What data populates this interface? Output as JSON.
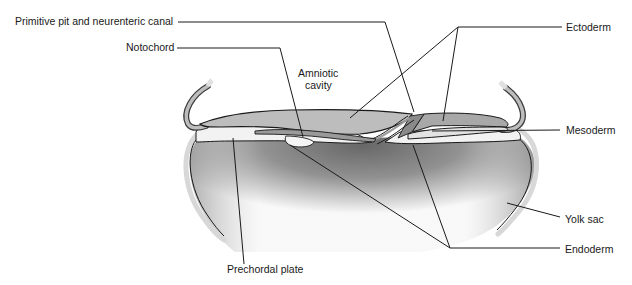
{
  "diagram": {
    "colors": {
      "amnion_fill": "#bdbdbd",
      "ectoderm_fill": "#a8a8a8",
      "mesoderm_fill": "#e6e6e6",
      "endoderm_fill": "#f0f0f0",
      "yolk_sac_dark": "#6e6e6e",
      "outline": "#1a1a1a"
    },
    "labels": {
      "primitive_pit": "Primitive pit and neurenteric canal",
      "notochord": "Notochord",
      "amniotic_cavity_line1": "Amniotic",
      "amniotic_cavity_line2": "cavity",
      "ectoderm": "Ectoderm",
      "mesoderm": "Mesoderm",
      "yolk_sac": "Yolk sac",
      "endoderm": "Endoderm",
      "prechordal_plate": "Prechordal plate"
    }
  }
}
